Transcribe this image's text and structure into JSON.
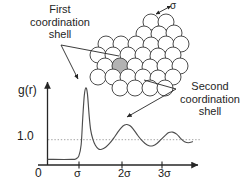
{
  "figure": {
    "annotations": {
      "first_shell": "First\ncoordination\nshell",
      "first_shell_line1": "First",
      "first_shell_line2": "coordination",
      "first_shell_line3": "shell",
      "second_shell_line1": "Second",
      "second_shell_line2": "coordination",
      "second_shell_line3": "shell",
      "diameter_label": "σ"
    },
    "colors": {
      "curve": "#4d4d4d",
      "axis": "#262626",
      "text": "#262626",
      "sphere_stroke": "#4d4d4d",
      "sphere_fill": "#ffffff",
      "highlight_sphere_fill": "#b3b3b3",
      "reference_line": "#999999",
      "background": "#ffffff"
    }
  },
  "chart_data": {
    "type": "line",
    "title": "",
    "subtitle": "",
    "xlabel": "r",
    "ylabel": "g(r)",
    "grid": false,
    "legend": null,
    "xlim": [
      0,
      3.75
    ],
    "ylim": [
      0,
      3.2
    ],
    "x_tick_labels": [
      "0",
      "σ",
      "2σ",
      "3σ"
    ],
    "x_tick_values": [
      0,
      1,
      2,
      3
    ],
    "y_tick_labels": [
      "1.0"
    ],
    "y_tick_values": [
      1.0
    ],
    "reference_line_y": 1.0,
    "axis_arrows": true,
    "series": [
      {
        "name": "g(r)",
        "x": [
          0.0,
          0.6,
          0.7,
          0.78,
          0.84,
          0.88,
          0.92,
          0.96,
          1.0,
          1.04,
          1.08,
          1.14,
          1.2,
          1.28,
          1.36,
          1.46,
          1.56,
          1.66,
          1.76,
          1.86,
          1.94,
          2.0,
          2.08,
          2.16,
          2.26,
          2.36,
          2.46,
          2.56,
          2.66,
          2.76,
          2.86,
          2.96,
          3.06,
          3.16,
          3.26,
          3.36,
          3.46,
          3.56,
          3.66
        ],
        "values": [
          0.22,
          0.22,
          0.24,
          0.35,
          0.8,
          1.85,
          2.75,
          3.05,
          2.8,
          2.0,
          1.4,
          1.0,
          0.78,
          0.63,
          0.62,
          0.7,
          0.85,
          1.05,
          1.28,
          1.48,
          1.58,
          1.6,
          1.55,
          1.42,
          1.2,
          1.0,
          0.85,
          0.76,
          0.76,
          0.85,
          1.0,
          1.15,
          1.28,
          1.3,
          1.22,
          1.05,
          0.92,
          0.88,
          0.92
        ]
      }
    ],
    "annotations": [
      {
        "text": "First coordination shell",
        "points_to_x": 1.0,
        "points_to_y": 3.05
      },
      {
        "text": "Second coordination shell",
        "points_to_x": 2.0,
        "points_to_y": 1.6
      }
    ]
  },
  "cluster": {
    "description": "hexagonally packed spheres",
    "highlight_index": 18,
    "spheres": [
      {
        "cx": 151,
        "cy": 22,
        "r": 8.0
      },
      {
        "cx": 166,
        "cy": 22,
        "r": 8.0
      },
      {
        "cx": 144,
        "cy": 34,
        "r": 8.0
      },
      {
        "cx": 159,
        "cy": 34,
        "r": 8.0
      },
      {
        "cx": 174,
        "cy": 33,
        "r": 8.0
      },
      {
        "cx": 106,
        "cy": 44,
        "r": 8.0
      },
      {
        "cx": 121,
        "cy": 44,
        "r": 8.0
      },
      {
        "cx": 136,
        "cy": 44,
        "r": 8.0
      },
      {
        "cx": 151,
        "cy": 45,
        "r": 8.0
      },
      {
        "cx": 166,
        "cy": 44,
        "r": 8.0
      },
      {
        "cx": 181,
        "cy": 44,
        "r": 8.0
      },
      {
        "cx": 98,
        "cy": 55,
        "r": 8.0
      },
      {
        "cx": 113,
        "cy": 55,
        "r": 8.0
      },
      {
        "cx": 128,
        "cy": 55,
        "r": 8.0
      },
      {
        "cx": 143,
        "cy": 55,
        "r": 8.0
      },
      {
        "cx": 158,
        "cy": 56,
        "r": 8.0
      },
      {
        "cx": 173,
        "cy": 55,
        "r": 8.0
      },
      {
        "cx": 105,
        "cy": 66,
        "r": 8.0
      },
      {
        "cx": 120,
        "cy": 66,
        "r": 8.0
      },
      {
        "cx": 135,
        "cy": 66,
        "r": 8.0
      },
      {
        "cx": 150,
        "cy": 67,
        "r": 8.0
      },
      {
        "cx": 165,
        "cy": 66,
        "r": 8.0
      },
      {
        "cx": 180,
        "cy": 66,
        "r": 8.0
      },
      {
        "cx": 98,
        "cy": 77,
        "r": 8.0
      },
      {
        "cx": 113,
        "cy": 77,
        "r": 8.0
      },
      {
        "cx": 128,
        "cy": 77,
        "r": 8.0
      },
      {
        "cx": 143,
        "cy": 77,
        "r": 8.0
      },
      {
        "cx": 158,
        "cy": 78,
        "r": 8.0
      },
      {
        "cx": 173,
        "cy": 77,
        "r": 8.0
      },
      {
        "cx": 120,
        "cy": 88,
        "r": 8.0
      },
      {
        "cx": 135,
        "cy": 88,
        "r": 8.0
      },
      {
        "cx": 150,
        "cy": 88,
        "r": 8.0
      },
      {
        "cx": 165,
        "cy": 88,
        "r": 8.0
      }
    ]
  }
}
